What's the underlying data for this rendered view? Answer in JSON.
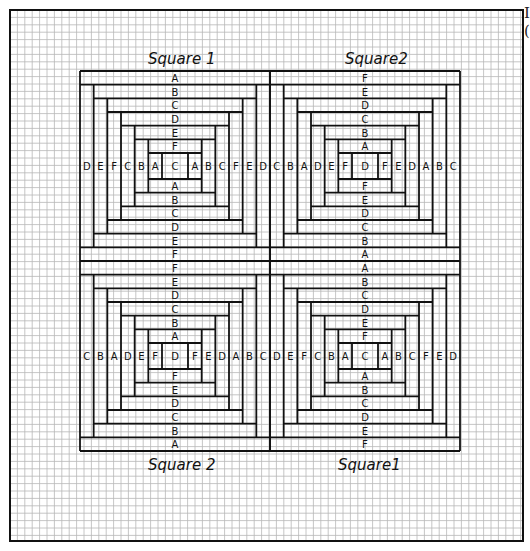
{
  "figure": {
    "colors": {
      "grid": "#b8b8b8",
      "ink": "#111111",
      "paper": "#ffffff"
    },
    "frame": {
      "x": 10,
      "y": 10,
      "w": 513,
      "h": 531
    },
    "grid_step": 7.4,
    "quilt": {
      "x": 80,
      "y": 71,
      "block_size": 190
    },
    "edge_text": [
      "I",
      "("
    ],
    "labels": {
      "top_left": "Square 1",
      "top_right": "Square2",
      "bottom_left": "Square 2",
      "bottom_right": "Square1"
    },
    "blocks": [
      {
        "name": "square-1",
        "position": "top-left",
        "center": "C",
        "top": [
          "A",
          "B",
          "C",
          "D",
          "E",
          "F"
        ],
        "bottom": [
          "F",
          "E",
          "D",
          "C",
          "B",
          "A"
        ],
        "left": [
          "D",
          "E",
          "F",
          "C",
          "B",
          "A"
        ],
        "right": [
          "A",
          "B",
          "C",
          "F",
          "E",
          "D"
        ]
      },
      {
        "name": "square-2",
        "position": "top-right",
        "center": "D",
        "top": [
          "F",
          "E",
          "D",
          "C",
          "B",
          "A"
        ],
        "bottom": [
          "A",
          "B",
          "C",
          "D",
          "E",
          "F"
        ],
        "left": [
          "C",
          "B",
          "A",
          "D",
          "E",
          "F"
        ],
        "right": [
          "F",
          "E",
          "D",
          "A",
          "B",
          "C"
        ]
      },
      {
        "name": "square-2",
        "position": "bottom-left",
        "center": "D",
        "top": [
          "F",
          "E",
          "D",
          "C",
          "B",
          "A"
        ],
        "bottom": [
          "A",
          "B",
          "C",
          "D",
          "E",
          "F"
        ],
        "left": [
          "C",
          "B",
          "A",
          "D",
          "E",
          "F"
        ],
        "right": [
          "F",
          "E",
          "D",
          "A",
          "B",
          "C"
        ]
      },
      {
        "name": "square-1",
        "position": "bottom-right",
        "center": "C",
        "top": [
          "A",
          "B",
          "C",
          "D",
          "E",
          "F"
        ],
        "bottom": [
          "F",
          "E",
          "D",
          "C",
          "B",
          "A"
        ],
        "left": [
          "D",
          "E",
          "F",
          "C",
          "B",
          "A"
        ],
        "right": [
          "A",
          "B",
          "C",
          "F",
          "E",
          "D"
        ]
      }
    ]
  }
}
